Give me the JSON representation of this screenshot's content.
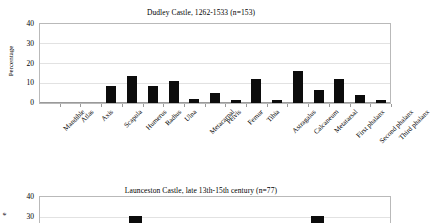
{
  "chart_data": [
    {
      "type": "bar",
      "title": "Dudley Castle, 1262-1533 (n=153)",
      "xlabel": "",
      "ylabel": "Percentage",
      "ylim": [
        0,
        40
      ],
      "yticks": [
        0,
        10,
        20,
        30,
        40
      ],
      "grid": true,
      "legend": "none",
      "bar_color": "#0c0c0c",
      "categories": [
        "Mandible",
        "Atlas",
        "Axis",
        "Scapula",
        "Humerus",
        "Radius",
        "Ulna",
        "Metacarpal",
        "Pelvis",
        "Femur",
        "Tibia",
        "Astragalus",
        "Calcaneum",
        "Metatarsal",
        "First phalanx",
        "Second phalanx",
        "Third phalanx"
      ],
      "values": [
        0,
        0,
        0,
        8.5,
        13.5,
        8.5,
        11,
        2,
        5,
        1.5,
        12,
        1.5,
        16,
        6.7,
        12.2,
        4,
        1.5
      ]
    },
    {
      "type": "bar",
      "title": "Launceston Castle, late 13th-15th century  (n=77)",
      "xlabel": "",
      "ylabel": "Percentage",
      "ylim": [
        0,
        40
      ],
      "yticks": [
        30,
        40
      ],
      "grid": true,
      "legend": "none",
      "bar_color": "#0c0c0c",
      "note": "chart is cut off by the bottom edge of the screenshot; only the top of the plot area and the tops of two tall bars are visible",
      "categories": [
        "bar-a",
        "bar-b"
      ],
      "values": [
        30,
        30
      ]
    }
  ],
  "charts": {
    "top": {
      "title": "Dudley Castle, 1262-1533 (n=153)",
      "ylabel": "Percentage",
      "yticks": [
        "40",
        "30",
        "20",
        "10",
        "0"
      ],
      "categories": [
        "Mandible",
        "Atlas",
        "Axis",
        "Scapula",
        "Humerus",
        "Radius",
        "Ulna",
        "Metacarpal",
        "Pelvis",
        "Femur",
        "Tibia",
        "Astragalus",
        "Calcaneum",
        "Metatarsal",
        "First phalanx",
        "Second phalanx",
        "Third phalanx"
      ]
    },
    "bottom": {
      "title": "Launceston Castle, late 13th-15th century  (n=77)",
      "ylabel": "e",
      "yticks": [
        "40",
        "30"
      ]
    }
  }
}
